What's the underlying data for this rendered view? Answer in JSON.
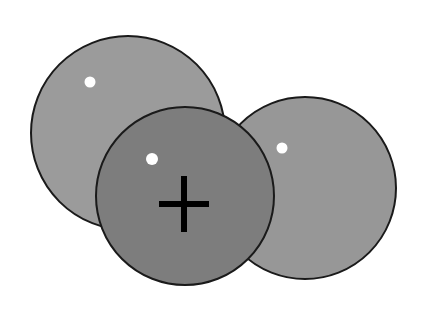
{
  "figure": {
    "canvas": {
      "width": 423,
      "height": 309,
      "background_color": "#ffffff"
    },
    "outline_color": "#1a1a1a",
    "outline_width": 2,
    "marker_color": "#ffffff",
    "crosshair_color": "#000000",
    "discs": [
      {
        "id": "disc-back-left",
        "label": "Left light gray disc",
        "cx": 128,
        "cy": 133,
        "r": 97,
        "fill": "#9b9b9b",
        "z": 1,
        "marker": {
          "cx": 90,
          "cy": 82,
          "r": 5.5
        }
      },
      {
        "id": "disc-mid-right",
        "label": "Right light gray disc",
        "cx": 305,
        "cy": 188,
        "r": 91,
        "fill": "#979797",
        "z": 2,
        "marker": {
          "cx": 282,
          "cy": 148,
          "r": 5.5
        }
      },
      {
        "id": "disc-front-center",
        "label": "Center dark gray disc",
        "cx": 185,
        "cy": 196,
        "r": 89,
        "fill": "#7d7d7d",
        "z": 3,
        "marker": {
          "cx": 152,
          "cy": 159,
          "r": 6
        }
      }
    ],
    "crosshair": {
      "cx": 184,
      "cy": 204,
      "half_width": 25,
      "half_height": 28,
      "thickness": 6
    },
    "caption": "Three overlapping gray discs with white index dots; the front center disc carries a black crosshair mark."
  }
}
